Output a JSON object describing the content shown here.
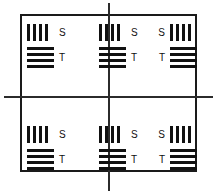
{
  "figure": {
    "name": "resolution-test-target",
    "background_color": "#ffffff",
    "ink_color": "#111111",
    "line_color": "#2b2b2b"
  },
  "frame": {
    "border_color": "#1a1a1a",
    "border_width_px": 2
  },
  "crosshair": {
    "vertical_line_color": "#2b2b2b",
    "horizontal_line_color": "#2b2b2b"
  },
  "labels": {
    "sagittal": "S",
    "tangential": "T"
  },
  "groups": [
    {
      "id": "top-left",
      "row": "top",
      "column": "left",
      "label_side": "right",
      "vertical_bar_count": 4,
      "horizontal_bar_count": 4,
      "sagittal_label": "S",
      "tangential_label": "T"
    },
    {
      "id": "top-center",
      "row": "top",
      "column": "center",
      "label_side": "right",
      "vertical_bar_count": 4,
      "horizontal_bar_count": 4,
      "sagittal_label": "S",
      "tangential_label": "T"
    },
    {
      "id": "top-right",
      "row": "top",
      "column": "right",
      "label_side": "left",
      "vertical_bar_count": 4,
      "horizontal_bar_count": 4,
      "sagittal_label": "S",
      "tangential_label": "T"
    },
    {
      "id": "bottom-left",
      "row": "bottom",
      "column": "left",
      "label_side": "right",
      "vertical_bar_count": 4,
      "horizontal_bar_count": 4,
      "sagittal_label": "S",
      "tangential_label": "T"
    },
    {
      "id": "bottom-center",
      "row": "bottom",
      "column": "center",
      "label_side": "right",
      "vertical_bar_count": 4,
      "horizontal_bar_count": 4,
      "sagittal_label": "S",
      "tangential_label": "T"
    },
    {
      "id": "bottom-right",
      "row": "bottom",
      "column": "right",
      "label_side": "left",
      "vertical_bar_count": 4,
      "horizontal_bar_count": 4,
      "sagittal_label": "S",
      "tangential_label": "T"
    }
  ]
}
